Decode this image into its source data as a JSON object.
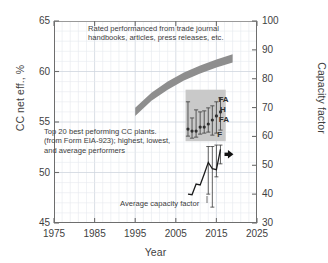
{
  "chart_data": {
    "type": "line",
    "title": "",
    "xlabel": "Year",
    "ylabel": "CC net eff., %",
    "ylabel_right": "Capacity factor",
    "xlim": [
      1975,
      2025
    ],
    "ylim": [
      45,
      65
    ],
    "ylim_right": [
      30,
      100
    ],
    "grid": true,
    "xticks": [
      "1975",
      "1985",
      "1995",
      "2005",
      "2015",
      "2025"
    ],
    "yticks_left": [
      "45",
      "50",
      "55",
      "60",
      "65"
    ],
    "yticks_right": [
      "30",
      "40",
      "50",
      "60",
      "70",
      "80",
      "90",
      "100"
    ],
    "legend_position": "none",
    "annotations": [
      {
        "name": "rated-performance-note",
        "text": "Rated performanced from trade journal\nhandbooks, articles, press releases, etc."
      },
      {
        "name": "top20-note",
        "text": "Top 20 best peforming CC plants.\n(from Form EIA-923); highest, lowest,\nand average performers"
      },
      {
        "name": "average-capacity-factor-note",
        "text": "Average capacity factor"
      }
    ],
    "series": [
      {
        "name": "Rated performance band",
        "type": "band",
        "color": "#8e8e8e",
        "x": [
          1995,
          1999,
          2003,
          2007,
          2011,
          2015,
          2019
        ],
        "y_lower": [
          55.6,
          57.1,
          58.2,
          59.1,
          59.8,
          60.4,
          60.9
        ],
        "y_upper": [
          56.4,
          57.9,
          59.0,
          59.9,
          60.6,
          61.2,
          61.7
        ]
      },
      {
        "name": "Top 20 CC plants net efficiency",
        "type": "errorbar",
        "color": "#4a4a4a",
        "x": [
          2008,
          2009,
          2010,
          2011,
          2012,
          2013,
          2014,
          2015,
          2016
        ],
        "avg": [
          54.3,
          54.1,
          54.1,
          54.5,
          54.5,
          54.8,
          55.2,
          55.6,
          56.0
        ],
        "low": [
          53.6,
          53.4,
          53.5,
          53.8,
          53.9,
          54.0,
          53.7,
          53.9,
          54.2
        ],
        "high": [
          57.0,
          55.4,
          56.2,
          56.0,
          56.1,
          56.4,
          56.6,
          57.0,
          57.4
        ],
        "point_labels": [
          "",
          "",
          "",
          "",
          "",
          "",
          "FA",
          "H",
          "FA",
          "F"
        ]
      },
      {
        "name": "Average capacity factor",
        "type": "line",
        "color": "#1b1b1b",
        "axis": "right",
        "x": [
          2008,
          2009,
          2010,
          2011,
          2012,
          2013,
          2014,
          2015,
          2016
        ],
        "y": [
          40.0,
          39.8,
          43.5,
          43.2,
          47.0,
          51.0,
          48.8,
          48.5,
          55.5
        ],
        "err_low": [
          null,
          null,
          null,
          null,
          null,
          40.0,
          35.5,
          46.0,
          50.5
        ],
        "err_high": [
          null,
          null,
          null,
          null,
          null,
          56.5,
          56.5,
          57.0,
          57.0
        ]
      }
    ],
    "inset_box": {
      "name": "top20-inset-region",
      "fill": "#c9c9c9",
      "x_range": [
        2007.4,
        2017.3
      ],
      "y_range": [
        53.1,
        58.2
      ]
    },
    "marker_labels": [
      {
        "text": "FA",
        "x": 2015.5,
        "y": 57.2
      },
      {
        "text": "H",
        "x": 2015.9,
        "y": 56.2
      },
      {
        "text": "FA",
        "x": 2015.6,
        "y": 55.2
      },
      {
        "text": "F",
        "x": 2015.2,
        "y": 53.7
      }
    ],
    "arrow": {
      "name": "trend-arrow",
      "color": "#111111",
      "x_start": 2017.0,
      "x_end": 2019.2,
      "y": 51.8
    }
  },
  "axes": {
    "left": {
      "title": "CC net eff., %",
      "ticks": [
        "65",
        "60",
        "55",
        "50",
        "45"
      ]
    },
    "right": {
      "title": "Capacity factor",
      "ticks": [
        "100",
        "90",
        "80",
        "70",
        "60",
        "50",
        "40",
        "30"
      ]
    },
    "bottom": {
      "title": "Year",
      "ticks": [
        "1975",
        "1985",
        "1995",
        "2005",
        "2015",
        "2025"
      ]
    }
  },
  "notes": {
    "rated": "Rated performanced from trade journal\nhandbooks, articles, press releases, etc.",
    "top20": "Top 20 best peforming CC plants.\n(from Form EIA-923); highest, lowest,\nand average performers",
    "avgcf": "Average capacity factor"
  },
  "inset_labels": {
    "l0": "FA",
    "l1": "H",
    "l2": "FA",
    "l3": "F"
  },
  "colors": {
    "band": "#8e8e8e",
    "inset_fill": "#c9c9c9",
    "grid": "#dfe4ea",
    "axis": "#6e6e6e",
    "text": "#3d3d3d",
    "line": "#1b1b1b"
  }
}
